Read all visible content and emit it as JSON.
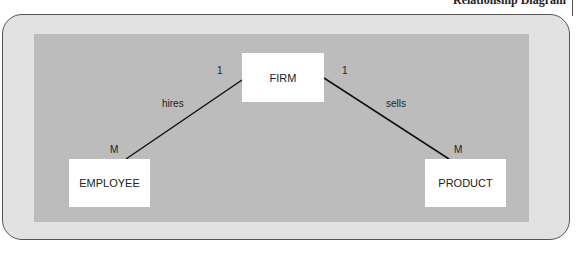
{
  "caption": "Relationship Diagram",
  "entities": {
    "firm": "FIRM",
    "employee": "EMPLOYEE",
    "product": "PRODUCT"
  },
  "relationships": [
    {
      "name": "hires",
      "from": "FIRM",
      "to": "EMPLOYEE",
      "from_card": "1",
      "to_card": "M"
    },
    {
      "name": "sells",
      "from": "FIRM",
      "to": "PRODUCT",
      "from_card": "1",
      "to_card": "M"
    }
  ],
  "colors": {
    "outer_bg": "#e2e2e2",
    "inner_bg": "#bcbcbc",
    "entity_bg": "#ffffff",
    "line": "#111111"
  }
}
